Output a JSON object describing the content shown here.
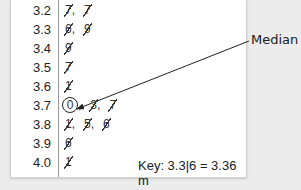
{
  "rows": [
    {
      "stem": "3.2",
      "leaves": [
        "7",
        "7"
      ]
    },
    {
      "stem": "3.3",
      "leaves": [
        "6",
        "9"
      ]
    },
    {
      "stem": "3.4",
      "leaves": [
        "9"
      ]
    },
    {
      "stem": "3.5",
      "leaves": [
        "7"
      ]
    },
    {
      "stem": "3.6",
      "leaves": [
        "1"
      ]
    },
    {
      "stem": "3.7",
      "leaves": [
        "0",
        "3",
        "7"
      ]
    },
    {
      "stem": "3.8",
      "leaves": [
        "1",
        "5",
        "6"
      ]
    },
    {
      "stem": "3.9",
      "leaves": [
        "6"
      ]
    },
    {
      "stem": "4.0",
      "leaves": [
        "1"
      ]
    }
  ],
  "key": "Key: 3.3|6 = 3.36 m",
  "annotation": {
    "label": "Median",
    "points_to": "3.7|0"
  },
  "colors": {
    "background": "#ececec",
    "panel": "#ffffff",
    "text": "#222222"
  }
}
